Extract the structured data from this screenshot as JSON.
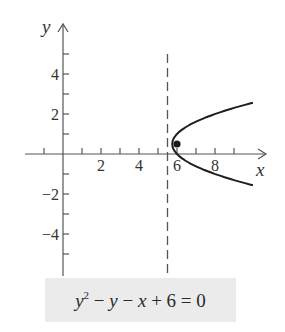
{
  "chart_data": {
    "type": "line",
    "title": "",
    "caption": {
      "text": "y^2 − y − x + 6 = 0",
      "parts": [
        "y",
        "2",
        " − ",
        "y",
        " − ",
        "x",
        " + 6 = 0"
      ]
    },
    "xlabel": "x",
    "ylabel": "y",
    "xlim": [
      -2,
      10.5
    ],
    "ylim": [
      -6,
      6
    ],
    "x_ticks": [
      -1,
      1,
      2,
      3,
      4,
      5,
      6,
      7,
      8,
      9
    ],
    "x_tick_labels": [
      "2",
      "4",
      "6",
      "8"
    ],
    "x_tick_label_values": [
      2,
      4,
      6,
      8
    ],
    "y_ticks": [
      -5,
      -4,
      -3,
      -2,
      -1,
      1,
      2,
      3,
      4,
      5
    ],
    "y_tick_labels": [
      "4",
      "2",
      "−2",
      "−4"
    ],
    "y_tick_label_values": [
      4,
      2,
      -2,
      -4
    ],
    "grid": false,
    "legend": null,
    "series": [
      {
        "name": "parabola",
        "equation": "x = y^2 - y + 6",
        "style": "solid",
        "points": [
          {
            "x": 10.0,
            "y": 2.56
          },
          {
            "x": 9.0,
            "y": 2.3
          },
          {
            "x": 8.0,
            "y": 2.0
          },
          {
            "x": 7.0,
            "y": 1.62
          },
          {
            "x": 6.25,
            "y": 1.21
          },
          {
            "x": 6.0,
            "y": 1.0
          },
          {
            "x": 5.75,
            "y": 0.5
          },
          {
            "x": 6.0,
            "y": 0.0
          },
          {
            "x": 6.25,
            "y": -0.21
          },
          {
            "x": 7.0,
            "y": -0.62
          },
          {
            "x": 8.0,
            "y": -1.0
          },
          {
            "x": 9.0,
            "y": -1.3
          },
          {
            "x": 10.0,
            "y": -1.56
          }
        ]
      },
      {
        "name": "directrix",
        "equation": "x = 5.5",
        "style": "dashed",
        "points": [
          {
            "x": 5.5,
            "y": 5.0
          },
          {
            "x": 5.5,
            "y": -6.0
          }
        ]
      },
      {
        "name": "focus",
        "style": "point",
        "points": [
          {
            "x": 6.0,
            "y": 0.5
          }
        ]
      }
    ]
  }
}
